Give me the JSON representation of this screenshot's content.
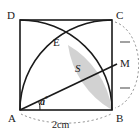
{
  "figure": {
    "kind": "geometry-diagram",
    "vertices": {
      "D": "D",
      "C": "C",
      "A": "A",
      "B": "B"
    },
    "points": {
      "E": "E",
      "M": "M"
    },
    "region_label": "S",
    "angle_label": "a",
    "angle_unit": "°",
    "side_length_label": "2cm",
    "tick_marks": {
      "upper": "tick-cm",
      "lower": "tick-mb",
      "count": 1,
      "meaning": "CM equals MB"
    },
    "colors": {
      "stroke": "#1a1a1a",
      "shaded_fill": "#d0d0d0",
      "shaded_stroke": "#1a1a1a",
      "dashed": "#7a7a7a",
      "background": "#ffffff"
    },
    "geometry": {
      "square": {
        "x": 20,
        "y": 20,
        "width": 92,
        "height": 90
      },
      "A": [
        20,
        110
      ],
      "B": [
        112,
        110
      ],
      "C": [
        112,
        20
      ],
      "D": [
        20,
        20
      ],
      "E": [
        68,
        45
      ],
      "M": [
        112,
        66
      ],
      "arc_A_to_C_center": "B",
      "arc_D_to_B_center": "A",
      "bottom_dimension_arc": "A to B",
      "right_dimension_arc": "C to B through M"
    }
  }
}
